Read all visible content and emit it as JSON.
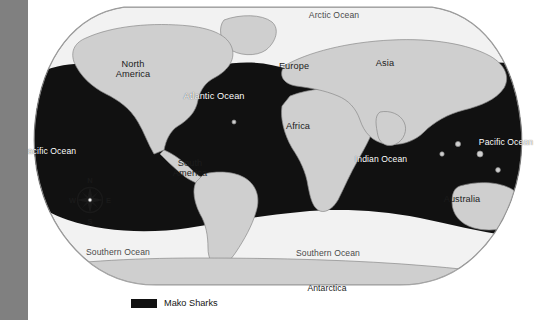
{
  "map": {
    "title": "World map of Mako Shark distribution",
    "projection": "robinson",
    "colors": {
      "range_fill": "#111111",
      "ocean_fill": "#f2f2f2",
      "land_fill": "#cfcfcf",
      "land_stroke": "#8a8a8a",
      "border": "#9a9a9a",
      "left_bar": "#808080",
      "page_background": "#ffffff"
    },
    "labels": [
      {
        "name": "arctic-ocean",
        "text": "Arctic Ocean",
        "kind": "ocean-light",
        "x": 334,
        "y": 14
      },
      {
        "name": "north-america",
        "text": "North\nAmerica",
        "kind": "land",
        "x": 133,
        "y": 66
      },
      {
        "name": "europe",
        "text": "Europe",
        "kind": "land",
        "x": 294,
        "y": 66
      },
      {
        "name": "asia",
        "text": "Asia",
        "kind": "land",
        "x": 385,
        "y": 63
      },
      {
        "name": "atlantic-ocean",
        "text": "Atlantic Ocean",
        "kind": "ocean-dark",
        "x": 214,
        "y": 96
      },
      {
        "name": "pacific-ocean-west",
        "text": "Pacific Ocean",
        "kind": "ocean-dark",
        "x": 49,
        "y": 150
      },
      {
        "name": "pacific-ocean-east",
        "text": "Pacific Ocean",
        "kind": "ocean-dark",
        "x": 506,
        "y": 141
      },
      {
        "name": "africa",
        "text": "Africa",
        "kind": "land",
        "x": 298,
        "y": 126
      },
      {
        "name": "indian-ocean",
        "text": "Indian Ocean",
        "kind": "ocean-dark",
        "x": 381,
        "y": 158
      },
      {
        "name": "south-america",
        "text": "South\nAmerica",
        "kind": "land",
        "x": 190,
        "y": 165
      },
      {
        "name": "australia",
        "text": "Australia",
        "kind": "land",
        "x": 462,
        "y": 199
      },
      {
        "name": "southern-ocean-west",
        "text": "Southern Ocean",
        "kind": "ocean-light",
        "x": 118,
        "y": 252
      },
      {
        "name": "southern-ocean-east",
        "text": "Southern Ocean",
        "kind": "ocean-light",
        "x": 328,
        "y": 253
      },
      {
        "name": "antarctica",
        "text": "Antarctica",
        "kind": "land",
        "x": 327,
        "y": 287
      }
    ],
    "compass": {
      "name": "compass-rose",
      "x": 66,
      "y": 174,
      "north": "N",
      "east": "E",
      "south": "S",
      "west": "W"
    }
  },
  "legend": {
    "swatch_color": "#111111",
    "label": "Mako Sharks"
  }
}
